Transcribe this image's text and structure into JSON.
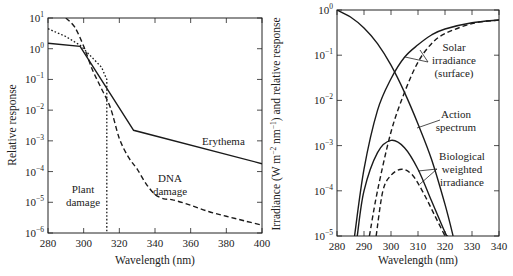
{
  "chart_data": [
    {
      "type": "line",
      "title": "",
      "xlabel": "Wavelength (nm)",
      "ylabel": "Relative response",
      "xlim": [
        280,
        400
      ],
      "ylim": [
        1e-06,
        10
      ],
      "yscale": "log",
      "grid": false,
      "x_ticks": [
        "280",
        "300",
        "320",
        "340",
        "360",
        "380",
        "400"
      ],
      "y_ticks": [
        "10^1",
        "10^0",
        "10^-1",
        "10^-2",
        "10^-3",
        "10^-4",
        "10^-5",
        "10^-6"
      ],
      "series": [
        {
          "name": "Erythema",
          "style": "solid",
          "x": [
            280,
            298,
            328,
            400
          ],
          "y": [
            1.5,
            1.2,
            0.0022,
            0.00018
          ]
        },
        {
          "name": "DNA damage",
          "style": "dashed",
          "x": [
            290,
            295,
            300,
            305,
            310,
            315,
            320,
            325,
            330,
            335,
            340,
            345,
            350,
            360,
            370,
            380,
            390,
            400
          ],
          "y": [
            10,
            5,
            1.2,
            0.2,
            0.05,
            0.012,
            0.0012,
            0.0003,
            0.00012,
            4e-05,
            1.8e-05,
            1.3e-05,
            1.2e-05,
            8e-06,
            5e-06,
            3.5e-06,
            2.5e-06,
            1.8e-06
          ]
        },
        {
          "name": "Plant damage",
          "style": "dotted",
          "x": [
            280,
            290,
            298,
            305,
            310,
            313,
            313
          ],
          "y": [
            4.5,
            2.5,
            1.3,
            0.5,
            0.25,
            0.1,
            1e-06
          ]
        }
      ],
      "annotations": [
        "Erythema",
        "DNA damage",
        "Plant damage"
      ]
    },
    {
      "type": "line",
      "title": "",
      "xlabel": "Wavelength (nm)",
      "ylabel": "Irradiance (W m^-2 nm^-1) and relative response",
      "xlim": [
        280,
        340
      ],
      "ylim": [
        1e-05,
        1
      ],
      "yscale": "log",
      "grid": false,
      "x_ticks": [
        "280",
        "290",
        "300",
        "310",
        "320",
        "330",
        "340"
      ],
      "y_ticks": [
        "10^0",
        "10^-1",
        "10^-2",
        "10^-3",
        "10^-4",
        "10^-5"
      ],
      "series": [
        {
          "name": "Action spectrum",
          "style": "solid",
          "x": [
            280,
            285,
            290,
            295,
            300,
            305,
            310,
            315,
            320,
            323
          ],
          "y": [
            1.0,
            0.7,
            0.4,
            0.18,
            0.06,
            0.015,
            0.003,
            0.0005,
            5e-05,
            1e-05
          ]
        },
        {
          "name": "Solar irradiance (surface) A",
          "style": "solid",
          "x": [
            286.5,
            290,
            295,
            300,
            305,
            310,
            315,
            320,
            330,
            340
          ],
          "y": [
            1e-05,
            0.0003,
            0.006,
            0.03,
            0.09,
            0.17,
            0.28,
            0.38,
            0.52,
            0.6
          ]
        },
        {
          "name": "Solar irradiance (surface) B",
          "style": "dashed",
          "x": [
            292,
            295,
            300,
            305,
            310,
            315,
            320,
            330,
            340
          ],
          "y": [
            1e-05,
            0.0001,
            0.002,
            0.015,
            0.07,
            0.18,
            0.3,
            0.5,
            0.6
          ]
        },
        {
          "name": "Biological weighted irradiance A",
          "style": "solid",
          "x": [
            287.5,
            290,
            295,
            300,
            305,
            310,
            315,
            320,
            321
          ],
          "y": [
            1e-05,
            0.0001,
            0.0007,
            0.0013,
            0.0009,
            0.0003,
            6e-05,
            1.2e-05,
            1e-05
          ]
        },
        {
          "name": "Biological weighted irradiance B",
          "style": "dashed",
          "x": [
            294.5,
            297,
            300,
            304,
            308,
            312,
            316,
            320
          ],
          "y": [
            1e-05,
            0.0001,
            0.00022,
            0.0003,
            0.00022,
            9e-05,
            3e-05,
            1e-05
          ]
        }
      ],
      "annotations": [
        "Solar irradiance (surface)",
        "Action spectrum",
        "Biological weighted irradiance"
      ]
    }
  ],
  "left": {
    "xlabel": "Wavelength (nm)",
    "ylabel": "Relative response",
    "x_ticks": [
      "280",
      "300",
      "320",
      "340",
      "360",
      "380",
      "400"
    ],
    "y_ticks": [
      {
        "base": "10",
        "exp": "1"
      },
      {
        "base": "10",
        "exp": "0"
      },
      {
        "base": "10",
        "exp": "−1"
      },
      {
        "base": "10",
        "exp": "−2"
      },
      {
        "base": "10",
        "exp": "−3"
      },
      {
        "base": "10",
        "exp": "−4"
      },
      {
        "base": "10",
        "exp": "−5"
      },
      {
        "base": "10",
        "exp": "−6"
      }
    ],
    "labels": {
      "erythema": "Erythema",
      "dna1": "DNA",
      "dna2": "damage",
      "plant1": "Plant",
      "plant2": "damage"
    }
  },
  "right": {
    "xlabel": "Wavelength (nm)",
    "ylabel_parts": [
      "Irradiance (W m",
      "−2",
      " nm",
      "−1",
      ") and relative response"
    ],
    "x_ticks": [
      "280",
      "290",
      "300",
      "310",
      "320",
      "330",
      "340"
    ],
    "y_ticks": [
      {
        "base": "10",
        "exp": "0"
      },
      {
        "base": "10",
        "exp": "−1"
      },
      {
        "base": "10",
        "exp": "−2"
      },
      {
        "base": "10",
        "exp": "−3"
      },
      {
        "base": "10",
        "exp": "−4"
      },
      {
        "base": "10",
        "exp": "−5"
      }
    ],
    "labels": {
      "solar1": "Solar",
      "solar2": "irradiance",
      "solar3": "(surface)",
      "action1": "Action",
      "action2": "spectrum",
      "bio1": "Biological",
      "bio2": "weighted",
      "bio3": "irradiance"
    }
  }
}
